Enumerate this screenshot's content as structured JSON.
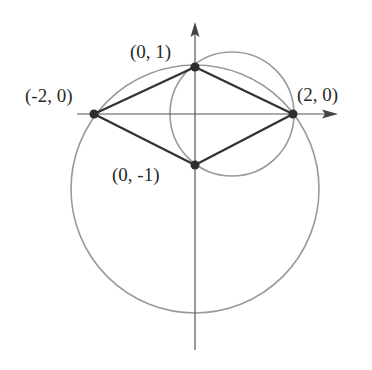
{
  "diagram": {
    "type": "coordinate-geometry",
    "colors": {
      "circle": "#9a9a9a",
      "axis": "#555555",
      "edge": "#333333",
      "vertex": "#2e2e2e",
      "label": "#2a2a2a"
    },
    "points": [
      {
        "id": "A",
        "label": "(-2, 0)",
        "x": -2,
        "y": 0
      },
      {
        "id": "B",
        "label": "(0, 1)",
        "x": 0,
        "y": 1
      },
      {
        "id": "C",
        "label": "(2, 0)",
        "x": 2,
        "y": 0
      },
      {
        "id": "D",
        "label": "(0, -1)",
        "x": 0,
        "y": -1
      }
    ],
    "edges": [
      [
        "A",
        "B"
      ],
      [
        "B",
        "C"
      ],
      [
        "C",
        "D"
      ],
      [
        "D",
        "A"
      ]
    ],
    "circles": [
      {
        "id": "large",
        "center": [
          0,
          -1.5
        ],
        "radius": 2.5,
        "through": [
          "A",
          "B",
          "C"
        ]
      },
      {
        "id": "small",
        "center": [
          0.75,
          0
        ],
        "radius": 1.25,
        "through": [
          "B",
          "C",
          "D"
        ]
      }
    ],
    "axes": {
      "x_axis": true,
      "y_axis": true,
      "arrows": true
    }
  },
  "labels": {
    "a": "(-2, 0)",
    "b": "(0, 1)",
    "c": "(2, 0)",
    "d": "(0, -1)"
  }
}
